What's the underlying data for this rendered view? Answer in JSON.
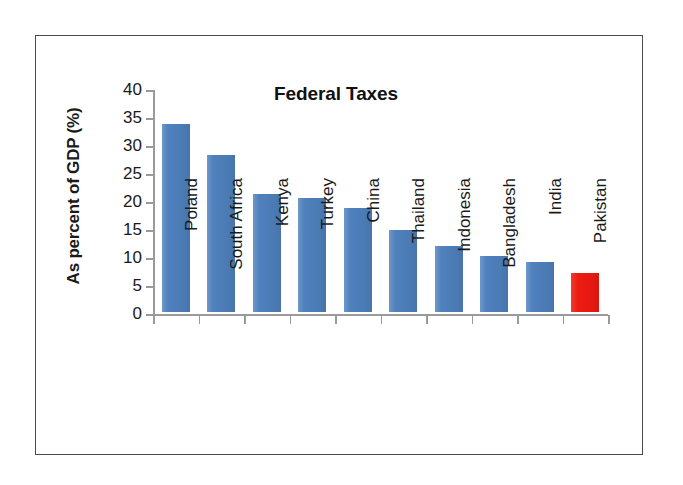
{
  "figure": {
    "border_color": "#4a4a4a",
    "background": "#ffffff"
  },
  "axis": {
    "y_title": "As percent of GDP (%)",
    "tick_labels": [
      "40",
      "35",
      "30",
      "25",
      "20",
      "15",
      "10",
      "5",
      "0"
    ]
  },
  "chart_data": {
    "type": "bar",
    "title": "Federal Taxes",
    "xlabel": "",
    "ylabel": "As percent of GDP (%)",
    "ylim": [
      0,
      40
    ],
    "ytick_step": 5,
    "yticks": [
      0,
      5,
      10,
      15,
      20,
      25,
      30,
      35,
      40
    ],
    "grid": false,
    "legend": false,
    "categories": [
      "Poland",
      "South Africa",
      "Kenya",
      "Turkey",
      "China",
      "Thailand",
      "Indonesia",
      "Bangladesh",
      "India",
      "Pakistan"
    ],
    "values": [
      33.5,
      28.0,
      21.0,
      20.4,
      18.5,
      14.7,
      11.8,
      10.0,
      9.0,
      7.0
    ],
    "bar_colors": [
      "#4f81bd",
      "#4f81bd",
      "#4f81bd",
      "#4f81bd",
      "#4f81bd",
      "#4f81bd",
      "#4f81bd",
      "#4f81bd",
      "#4f81bd",
      "#ee1b11"
    ],
    "highlight_category": "Pakistan",
    "series": [
      {
        "name": "Federal Taxes",
        "values": [
          33.5,
          28.0,
          21.0,
          20.4,
          18.5,
          14.7,
          11.8,
          10.0,
          9.0,
          7.0
        ]
      }
    ]
  }
}
